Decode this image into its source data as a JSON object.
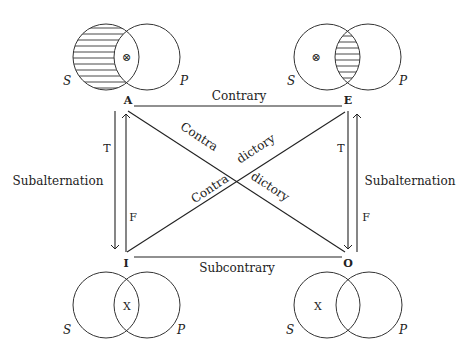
{
  "colors": {
    "ink": "#222222",
    "background": "#ffffff"
  },
  "corners": {
    "A": {
      "label": "A",
      "x": 128,
      "y": 104
    },
    "E": {
      "label": "E",
      "x": 348,
      "y": 104
    },
    "I": {
      "label": "I",
      "x": 126,
      "y": 266
    },
    "O": {
      "label": "O",
      "x": 348,
      "y": 266
    }
  },
  "relations": {
    "top": "Contrary",
    "bottom": "Subcontrary",
    "left": "Subalternation",
    "right": "Subalternation",
    "diag_ao_part1": "Contra",
    "diag_ao_part2": "dictory",
    "diag_ie_part1": "Contra",
    "diag_ie_part2": "dictory"
  },
  "arrows": {
    "left_down": {
      "label": "T",
      "direction": "down"
    },
    "left_up": {
      "label": "F",
      "direction": "up"
    },
    "right_down": {
      "label": "T",
      "direction": "down"
    },
    "right_up": {
      "label": "F",
      "direction": "up"
    }
  },
  "venn": {
    "A": {
      "s_label": "S",
      "p_label": "P",
      "shaded": "S-only",
      "mark": "⊗",
      "mark_region": "S∩P"
    },
    "E": {
      "s_label": "S",
      "p_label": "P",
      "shaded": "S∩P",
      "mark": "⊗",
      "mark_region": "S-only"
    },
    "I": {
      "s_label": "S",
      "p_label": "P",
      "shaded": "none",
      "mark": "X",
      "mark_region": "S∩P"
    },
    "O": {
      "s_label": "S",
      "p_label": "P",
      "shaded": "none",
      "mark": "X",
      "mark_region": "S-only"
    }
  }
}
